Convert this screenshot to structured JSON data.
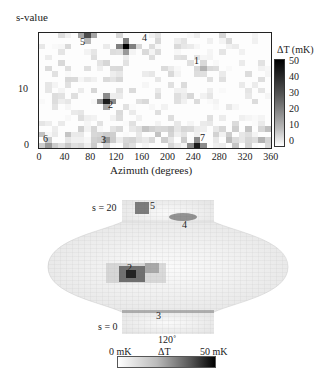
{
  "figure_top": {
    "ylabel": "s-value",
    "xlabel": "Azimuth (degrees)",
    "xticks": [
      "0",
      "40",
      "80",
      "120",
      "160",
      "200",
      "240",
      "280",
      "320",
      "360"
    ],
    "yticks": [
      "0",
      "10"
    ],
    "colorbar": {
      "title": "ΔT (mK)",
      "ticks": [
        "50",
        "40",
        "30",
        "20",
        "10",
        "0"
      ]
    },
    "annotations": [
      "1",
      "2",
      "3",
      "4",
      "5",
      "6",
      "7"
    ]
  },
  "figure_bottom": {
    "label_top": "s = 20",
    "label_bottom": "s = 0",
    "azimuth_label": "120˚",
    "colorbar": {
      "min_label": "0 mK",
      "mid_label": "ΔT",
      "max_label": "50 mK"
    },
    "annotations": [
      "2",
      "3",
      "4",
      "5"
    ]
  },
  "chart_data": [
    {
      "type": "heatmap",
      "title": "",
      "xlabel": "Azimuth (degrees)",
      "ylabel": "s-value",
      "xlim": [
        0,
        360
      ],
      "ylim": [
        0,
        20
      ],
      "colorbar_label": "ΔT (mK)",
      "colorbar_range": [
        0,
        50
      ],
      "hotspots": [
        {
          "id": "1",
          "azimuth": 250,
          "s": 14,
          "dT_mK": 15
        },
        {
          "id": "2",
          "azimuth": 100,
          "s": 8,
          "dT_mK": 45
        },
        {
          "id": "3",
          "azimuth": 100,
          "s": 1,
          "dT_mK": 20
        },
        {
          "id": "4",
          "azimuth": 135,
          "s": 18,
          "dT_mK": 50
        },
        {
          "id": "5",
          "azimuth": 75,
          "s": 20,
          "dT_mK": 35
        },
        {
          "id": "6",
          "azimuth": 10,
          "s": 0,
          "dT_mK": 20
        },
        {
          "id": "7",
          "azimuth": 240,
          "s": 0,
          "dT_mK": 45
        }
      ]
    },
    {
      "type": "heatmap",
      "title": "3D surface map",
      "colorbar_label": "ΔT",
      "colorbar_range_mK": [
        0,
        50
      ],
      "axis_labels": [
        "s = 20",
        "s = 0",
        "120˚"
      ]
    }
  ]
}
